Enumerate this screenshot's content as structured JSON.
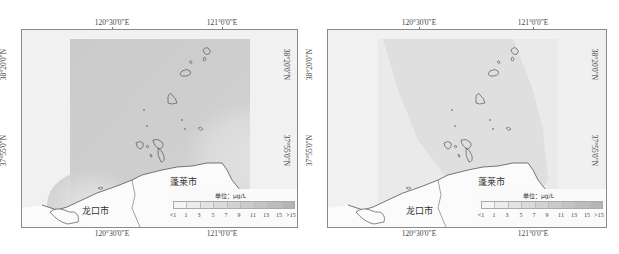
{
  "maps": [
    {
      "id": "left",
      "top_ticks": [
        "120°30'0\"E",
        "121°0'0\"E"
      ],
      "bottom_ticks": [
        "120°30'0\"E",
        "121°0'0\"E"
      ],
      "left_ticks": [
        "38°20'0\"N",
        "37°55'0\"N"
      ],
      "right_ticks": [
        "38°20'0\"N",
        "37°55'0\"N"
      ],
      "places": [
        "龙口市",
        "蓬莱市"
      ],
      "legend": {
        "title": "单位：μg/L",
        "labels": [
          "<1",
          "1",
          "3",
          "5",
          "7",
          "9",
          "11",
          "13",
          "15",
          ">15"
        ],
        "colors": [
          "#f4f4f4",
          "#ececec",
          "#e3e3e3",
          "#dadada",
          "#d2d2d2",
          "#cacaca",
          "#c3c3c3",
          "#bcbcbc",
          "#b5b5b5"
        ]
      },
      "colors": {
        "background": "#f1f1f1",
        "field": "#cfcfcf",
        "field_light": "#e6e6e6",
        "land": "#fbfbfb",
        "coast": "#555555"
      }
    },
    {
      "id": "right",
      "top_ticks": [
        "120°30'0\"E",
        "121°0'0\"E"
      ],
      "bottom_ticks": [
        "120°30'0\"E",
        "121°0'0\"E"
      ],
      "left_ticks": [
        "38°20'0\"N",
        "37°55'0\"N"
      ],
      "right_ticks": [
        "38°20'0\"N",
        "37°55'0\"N"
      ],
      "places": [
        "龙口市",
        "蓬莱市"
      ],
      "legend": {
        "title": "单位：μg/L",
        "labels": [
          "<1",
          "1",
          "3",
          "5",
          "7",
          "9",
          "11",
          "13",
          "15",
          ">15"
        ],
        "colors": [
          "#f4f4f4",
          "#ececec",
          "#e3e3e3",
          "#dadada",
          "#d2d2d2",
          "#cacaca",
          "#c3c3c3",
          "#bcbcbc",
          "#b5b5b5"
        ]
      },
      "colors": {
        "background": "#f0f0f0",
        "field": "#e2e2e2",
        "field_light": "#ececec",
        "land": "#fbfbfb",
        "coast": "#555555"
      }
    }
  ]
}
